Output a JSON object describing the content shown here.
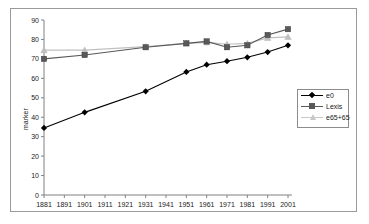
{
  "chart_data": {
    "type": "line",
    "title": "",
    "xlabel": "",
    "ylabel": "marker",
    "ylim": [
      0,
      90
    ],
    "ytick_step": 10,
    "yticks": [
      0,
      10,
      20,
      30,
      40,
      50,
      60,
      70,
      80,
      90
    ],
    "grid": false,
    "legend_position": "right",
    "axis_tick_labels_x": [
      "1881",
      "1891",
      "1901",
      "1911",
      "1921",
      "1931",
      "1941",
      "1951",
      "1961",
      "1971",
      "1981",
      "1991",
      "2001"
    ],
    "x": [
      1881,
      1901,
      1931,
      1951,
      1961,
      1971,
      1981,
      1991,
      2001
    ],
    "series": [
      {
        "name": "e0",
        "marker": "diamond",
        "color": "#000000",
        "values": [
          34.5,
          42.5,
          53.3,
          63.3,
          67.0,
          68.8,
          70.8,
          73.5,
          77.0
        ]
      },
      {
        "name": "Lexis",
        "marker": "square",
        "color": "#595959",
        "values": [
          70.0,
          72.0,
          76.0,
          78.0,
          79.0,
          76.0,
          77.0,
          82.3,
          85.3
        ]
      },
      {
        "name": "e65+65",
        "marker": "triangle",
        "color": "#c0c0c0",
        "values": [
          74.5,
          74.5,
          76.3,
          78.0,
          78.5,
          77.5,
          78.0,
          80.8,
          81.3
        ]
      }
    ]
  },
  "legend": {
    "items": [
      {
        "label": "e0"
      },
      {
        "label": "Lexis"
      },
      {
        "label": "e65+65"
      }
    ]
  },
  "colors": {
    "series_e0": "#000000",
    "series_lexis": "#595959",
    "series_e65": "#c0c0c0",
    "axis": "#808080",
    "border": "#9a9a9a",
    "text": "#1a1a1a"
  }
}
